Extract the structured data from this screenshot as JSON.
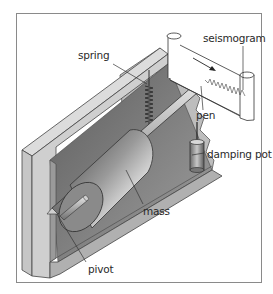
{
  "diagram": {
    "labels": {
      "spring": "spring",
      "seismogram": "seismogram",
      "pen": "pen",
      "damping_pot": "damping pot",
      "mass": "mass",
      "pivot": "pivot"
    },
    "components": [
      "frame",
      "spring",
      "rod",
      "mass",
      "damping pot",
      "pivot",
      "pen",
      "seismogram paper roll"
    ],
    "colors": {
      "frame_border": "#8a8a8a",
      "box_light": "#d4d4d4",
      "box_mid": "#b8b8b8",
      "box_dark": "#8f8f8f",
      "mass_dark": "#5a5a5a",
      "line": "#333333"
    }
  }
}
